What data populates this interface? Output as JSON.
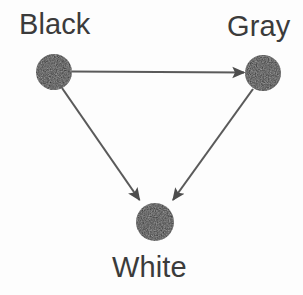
{
  "diagram": {
    "type": "directed-graph",
    "background_color": "#fdfdfd",
    "node_fill_color": "#2a2a2a",
    "edge_color": "#5a5a5a",
    "label_color": "#3b3b3b",
    "nodes": [
      {
        "id": "black",
        "label": "Black",
        "cx": 54,
        "cy": 72,
        "r": 18,
        "label_position": "above"
      },
      {
        "id": "gray",
        "label": "Gray",
        "cx": 263,
        "cy": 73,
        "r": 18,
        "label_position": "above"
      },
      {
        "id": "white",
        "label": "White",
        "cx": 155,
        "cy": 222,
        "r": 19,
        "label_position": "below"
      }
    ],
    "edges": [
      {
        "from": "black",
        "to": "gray",
        "directed": true,
        "arrowhead": "at-target"
      },
      {
        "from": "black",
        "to": "white",
        "directed": true,
        "arrowhead": "at-target"
      },
      {
        "from": "gray",
        "to": "white",
        "directed": true,
        "arrowhead": "at-target"
      }
    ]
  }
}
